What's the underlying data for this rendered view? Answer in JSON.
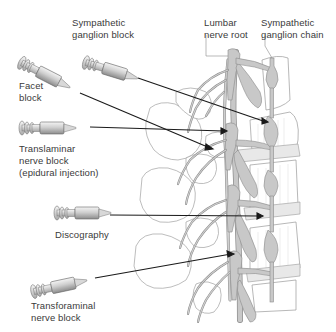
{
  "diagram": {
    "labels": {
      "sympathetic_ganglion_block": [
        "Sympathetic",
        "ganglion block"
      ],
      "facet_block": [
        "Facet",
        "block"
      ],
      "translaminar_nerve_block": [
        "Translaminar",
        "nerve block",
        "(epidural injection)"
      ],
      "discography": [
        "Discography"
      ],
      "transforaminal_nerve_block": [
        "Transforaminal",
        "nerve block"
      ],
      "lumbar_nerve_root": [
        "Lumbar",
        "nerve root"
      ],
      "sympathetic_ganglion_chain": [
        "Sympathetic",
        "ganglion chain"
      ]
    },
    "needles": [
      {
        "name": "sympathetic-ganglion-block",
        "from": [
          138,
          78
        ],
        "to": [
          268,
          122
        ]
      },
      {
        "name": "facet-block",
        "from": [
          80,
          93
        ],
        "to": [
          212,
          148
        ]
      },
      {
        "name": "translaminar-nerve-block",
        "from": [
          90,
          127
        ],
        "to": [
          226,
          131
        ]
      },
      {
        "name": "discography",
        "from": [
          110,
          215
        ],
        "to": [
          262,
          216
        ]
      },
      {
        "name": "transforaminal-nerve-block",
        "from": [
          95,
          278
        ],
        "to": [
          233,
          254
        ]
      }
    ],
    "colors": {
      "nerve_fill": "#c8c8c8",
      "nerve_stroke": "#8a8a8a",
      "bone_stroke": "#9a9a9a",
      "needle_line": "#1a1a1a",
      "syringe_fill": "#d4d4d4",
      "text": "#3a3a3a"
    }
  }
}
